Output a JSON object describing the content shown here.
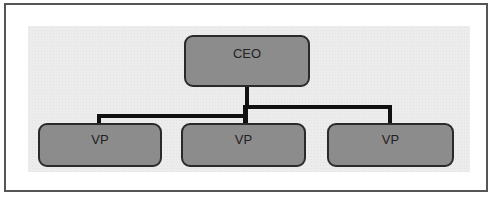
{
  "diagram": {
    "type": "org-chart",
    "root": {
      "label": "CEO"
    },
    "children": [
      {
        "label": "VP"
      },
      {
        "label": "VP"
      },
      {
        "label": "VP"
      }
    ]
  },
  "colors": {
    "node_fill": "#9a9a9a",
    "node_border": "#2a2a2a",
    "connector": "#111111",
    "panel": "#ececec",
    "frame_border": "#555555"
  }
}
